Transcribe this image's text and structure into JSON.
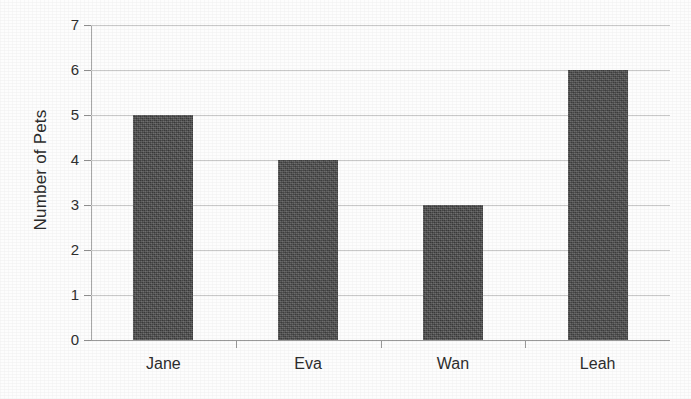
{
  "chart_data": {
    "type": "bar",
    "title": "",
    "subtitle": "",
    "xlabel": "",
    "ylabel": "Number of Pets",
    "categories": [
      "Jane",
      "Eva",
      "Wan",
      "Leah"
    ],
    "values": [
      5,
      4,
      3,
      6
    ],
    "ylim": [
      0,
      7
    ],
    "ytick_labels": [
      "0",
      "1",
      "2",
      "3",
      "4",
      "5",
      "6",
      "7"
    ],
    "ytick_values": [
      0,
      1,
      2,
      3,
      4,
      5,
      6,
      7
    ],
    "grid": true,
    "grid_axis": "y",
    "legend": false,
    "legend_position": "none",
    "bar_color": "#4a4a4a",
    "gridline_color": "#c9c9c9",
    "axis_color": "#a8a8a8",
    "background_color": "#fdfdfd",
    "text_color": "#2d2d2d"
  }
}
